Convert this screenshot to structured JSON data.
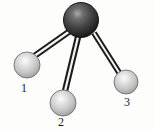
{
  "figure": {
    "type": "molecular-ball-and-stick-diagram",
    "background_color": "#fdfdfb",
    "width": 154,
    "height": 130,
    "bond_style": "double-line-tube",
    "bond_edge_color": "#1c1c1c",
    "bond_fill_color": "#f2f2f2"
  },
  "atoms": [
    {
      "id": "central",
      "label": "",
      "kind": "central-atom",
      "color": "#3a3a3a",
      "highlight_color": "#9a9a9a",
      "shadow_color": "#141414",
      "cx": 81,
      "cy": 20,
      "r": 17.5
    },
    {
      "id": "atom1",
      "label": "1",
      "kind": "terminal-atom",
      "color": "#c9c9c9",
      "highlight_color": "#f0f0f0",
      "shadow_color": "#8e8e8e",
      "cx": 27,
      "cy": 65,
      "r": 13
    },
    {
      "id": "atom2",
      "label": "2",
      "kind": "terminal-atom",
      "color": "#c9c9c9",
      "highlight_color": "#f0f0f0",
      "shadow_color": "#8e8e8e",
      "cx": 63,
      "cy": 103,
      "r": 13
    },
    {
      "id": "atom3",
      "label": "3",
      "kind": "terminal-atom",
      "color": "#c9c9c9",
      "highlight_color": "#f0f0f0",
      "shadow_color": "#8e8e8e",
      "cx": 126,
      "cy": 82,
      "r": 12
    }
  ],
  "bonds": [
    {
      "id": "bond-central-1",
      "from": "central",
      "to": "atom1",
      "x1": 70,
      "y1": 31,
      "x2": 33,
      "y2": 57
    },
    {
      "id": "bond-central-2",
      "from": "central",
      "to": "atom2",
      "x1": 78,
      "y1": 37,
      "x2": 65,
      "y2": 91
    },
    {
      "id": "bond-central-3",
      "from": "central",
      "to": "atom3",
      "x1": 94,
      "y1": 33,
      "x2": 120,
      "y2": 74
    }
  ],
  "labels": [
    {
      "id": "label-1",
      "text": "1",
      "x": 21,
      "y": 82
    },
    {
      "id": "label-2",
      "text": "2",
      "x": 58,
      "y": 116
    },
    {
      "id": "label-3",
      "text": "3",
      "x": 124,
      "y": 96
    }
  ]
}
